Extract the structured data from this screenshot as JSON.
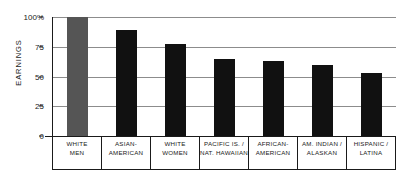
{
  "chart_data": {
    "type": "bar",
    "title": "",
    "xlabel": "",
    "ylabel": "EARNINGS",
    "ylim": [
      0,
      100
    ],
    "yticks": [
      {
        "value": 100,
        "label": "100%"
      },
      {
        "value": 75,
        "label": "75"
      },
      {
        "value": 50,
        "label": "50"
      },
      {
        "value": 25,
        "label": "25"
      },
      {
        "value": 0,
        "label": "0"
      }
    ],
    "grid": "horizontal",
    "legend": "none",
    "categories": [
      {
        "lines": [
          "WHITE",
          "MEN"
        ]
      },
      {
        "lines": [
          "ASIAN-",
          "AMERICAN"
        ]
      },
      {
        "lines": [
          "WHITE",
          "WOMEN"
        ]
      },
      {
        "lines": [
          "PACIFIC IS. /",
          "NAT. HAWAIIAN"
        ]
      },
      {
        "lines": [
          "AFRICAN-",
          "AMERICAN"
        ]
      },
      {
        "lines": [
          "AM. INDIAN /",
          "ALASKAN"
        ]
      },
      {
        "lines": [
          "HISPANIC /",
          "LATINA"
        ]
      }
    ],
    "values": [
      100,
      89,
      77,
      65,
      63,
      60,
      53
    ],
    "bar_colors": [
      "#555555",
      "#111111",
      "#111111",
      "#111111",
      "#111111",
      "#111111",
      "#111111"
    ],
    "colors": {
      "reference_bar": "#555555",
      "bar": "#111111",
      "gridline": "#8c8c8c",
      "axis": "#1a1a1a",
      "background": "#ffffff"
    }
  }
}
